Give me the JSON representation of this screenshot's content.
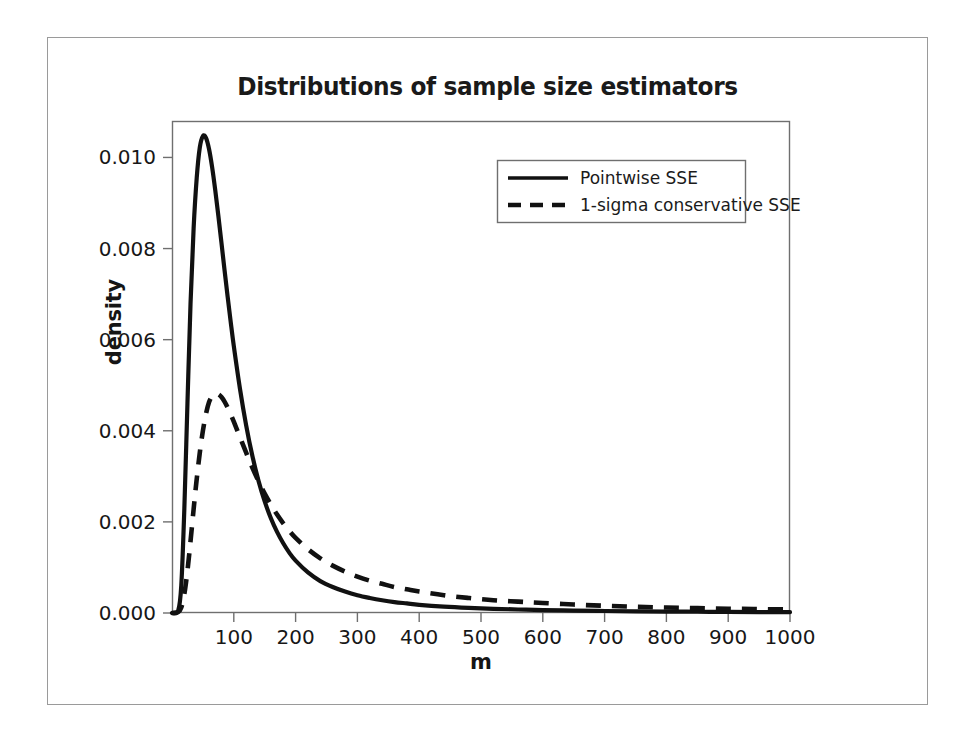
{
  "figure": {
    "title": "Distributions of sample size estimators",
    "background_color": "#ffffff",
    "frame_color": "#9a9a9a",
    "ink_color": "#111111"
  },
  "axes": {
    "x_label": "m",
    "y_label": "density",
    "x_ticks": [
      "100",
      "200",
      "300",
      "400",
      "500",
      "600",
      "700",
      "800",
      "900",
      "1000"
    ],
    "y_ticks": [
      "0.000",
      "0.002",
      "0.004",
      "0.006",
      "0.008",
      "0.010"
    ]
  },
  "legend": {
    "position": "top-right-inside",
    "entries": [
      {
        "label": "Pointwise SSE",
        "style": "solid"
      },
      {
        "label": "1-sigma conservative SSE",
        "style": "dashed"
      }
    ]
  },
  "chart_data": {
    "type": "line",
    "title": "Distributions of sample size estimators",
    "xlabel": "m",
    "ylabel": "density",
    "xlim": [
      0,
      1000
    ],
    "ylim": [
      0.0,
      0.0108
    ],
    "grid": false,
    "legend_position": "upper right",
    "x": [
      0,
      10,
      15,
      20,
      25,
      30,
      35,
      40,
      45,
      50,
      55,
      60,
      65,
      70,
      75,
      80,
      85,
      90,
      95,
      100,
      110,
      120,
      130,
      140,
      150,
      160,
      170,
      180,
      190,
      200,
      220,
      240,
      260,
      280,
      300,
      320,
      340,
      360,
      380,
      400,
      440,
      480,
      520,
      560,
      600,
      650,
      700,
      750,
      800,
      850,
      900,
      950,
      1000
    ],
    "series": [
      {
        "name": "Pointwise SSE",
        "style": "solid",
        "color": "#111111",
        "values": [
          0.0,
          5e-05,
          0.0006,
          0.0023,
          0.0046,
          0.0068,
          0.00845,
          0.00955,
          0.01022,
          0.01047,
          0.01043,
          0.01018,
          0.00978,
          0.00928,
          0.00872,
          0.00813,
          0.00753,
          0.00695,
          0.00639,
          0.00586,
          0.00492,
          0.00412,
          0.00345,
          0.0029,
          0.00245,
          0.00208,
          0.00178,
          0.00153,
          0.00132,
          0.00115,
          0.00089,
          0.0007,
          0.00057,
          0.00047,
          0.00039,
          0.00033,
          0.00028,
          0.00024,
          0.00021,
          0.00018,
          0.00014,
          0.000112,
          9.2e-05,
          7.7e-05,
          6.5e-05,
          5.3e-05,
          4.4e-05,
          3.7e-05,
          3.1e-05,
          2.7e-05,
          2.3e-05,
          2e-05,
          1.8e-05
        ],
        "peak": {
          "x": 50,
          "y": 0.01047
        }
      },
      {
        "name": "1-sigma conservative SSE",
        "style": "dashed",
        "color": "#111111",
        "values": [
          0.0,
          2e-05,
          0.00012,
          0.00042,
          0.00093,
          0.00158,
          0.00228,
          0.00294,
          0.00352,
          0.004,
          0.00437,
          0.00463,
          0.00476,
          0.00481,
          0.0048,
          0.00474,
          0.00464,
          0.00451,
          0.00436,
          0.0042,
          0.00386,
          0.00352,
          0.00319,
          0.00289,
          0.00262,
          0.00238,
          0.00216,
          0.00197,
          0.0018,
          0.00165,
          0.0014,
          0.0012,
          0.00104,
          0.00091,
          0.0008,
          0.00071,
          0.00064,
          0.00057,
          0.00052,
          0.00047,
          0.00039,
          0.00033,
          0.00028,
          0.00025,
          0.00022,
          0.000185,
          0.000158,
          0.000137,
          0.00012,
          0.000106,
          9.4e-05,
          8.5e-05,
          7.7e-05
        ],
        "peak": {
          "x": 70,
          "y": 0.00481
        }
      }
    ]
  }
}
